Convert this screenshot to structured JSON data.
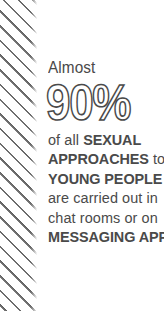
{
  "colors": {
    "background": "#ffffff",
    "text": "#4a4a4a",
    "stripe": "#6d6d6d"
  },
  "decor": {
    "stripe_band_name": "diagonal-stripe-band"
  },
  "infographic": {
    "kicker": "Almost",
    "stat": "90%",
    "body_lines": [
      {
        "id": "line-1",
        "segments": [
          {
            "text": "of all ",
            "weight": "regular"
          },
          {
            "text": "SEXUAL",
            "weight": "bold"
          }
        ]
      },
      {
        "id": "line-2",
        "segments": [
          {
            "text": "APPROACHES",
            "weight": "bold"
          },
          {
            "text": " to",
            "weight": "regular"
          }
        ]
      },
      {
        "id": "line-3",
        "segments": [
          {
            "text": "YOUNG PEOPLE",
            "weight": "bold"
          }
        ]
      },
      {
        "id": "line-4",
        "segments": [
          {
            "text": "are carried out in",
            "weight": "regular"
          }
        ]
      },
      {
        "id": "line-5",
        "segments": [
          {
            "text": "chat rooms or on",
            "weight": "regular"
          }
        ]
      },
      {
        "id": "line-6",
        "segments": [
          {
            "text": "MESSAGING APPS.",
            "weight": "bold"
          }
        ]
      }
    ],
    "full_text": "Almost 90% of all SEXUAL APPROACHES to YOUNG PEOPLE are carried out in chat rooms or on MESSAGING APPS."
  }
}
